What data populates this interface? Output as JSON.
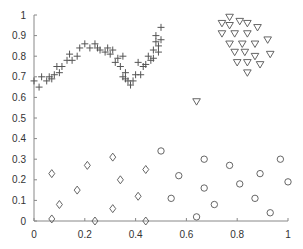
{
  "chart_data": {
    "type": "scatter",
    "title": "",
    "xlabel": "",
    "ylabel": "",
    "xlim": [
      0,
      1
    ],
    "ylim": [
      0,
      1
    ],
    "grid": false,
    "legend": null,
    "x_ticks": [
      "0",
      "0.2",
      "0.4",
      "0.6",
      "0.8",
      "1"
    ],
    "y_ticks": [
      "0",
      "0.1",
      "0.2",
      "0.3",
      "0.4",
      "0.5",
      "0.6",
      "0.7",
      "0.8",
      "0.9",
      "1"
    ],
    "series": [
      {
        "name": "plus",
        "marker": "+",
        "points": [
          [
            0.0,
            0.68
          ],
          [
            0.02,
            0.65
          ],
          [
            0.03,
            0.7
          ],
          [
            0.05,
            0.68
          ],
          [
            0.06,
            0.7
          ],
          [
            0.07,
            0.69
          ],
          [
            0.08,
            0.71
          ],
          [
            0.09,
            0.75
          ],
          [
            0.1,
            0.72
          ],
          [
            0.11,
            0.75
          ],
          [
            0.13,
            0.78
          ],
          [
            0.14,
            0.81
          ],
          [
            0.15,
            0.78
          ],
          [
            0.17,
            0.8
          ],
          [
            0.18,
            0.84
          ],
          [
            0.2,
            0.86
          ],
          [
            0.22,
            0.84
          ],
          [
            0.24,
            0.86
          ],
          [
            0.25,
            0.84
          ],
          [
            0.26,
            0.83
          ],
          [
            0.28,
            0.82
          ],
          [
            0.29,
            0.84
          ],
          [
            0.3,
            0.81
          ],
          [
            0.31,
            0.83
          ],
          [
            0.32,
            0.77
          ],
          [
            0.33,
            0.79
          ],
          [
            0.34,
            0.75
          ],
          [
            0.35,
            0.8
          ],
          [
            0.35,
            0.7
          ],
          [
            0.36,
            0.72
          ],
          [
            0.36,
            0.69
          ],
          [
            0.37,
            0.68
          ],
          [
            0.38,
            0.66
          ],
          [
            0.39,
            0.68
          ],
          [
            0.4,
            0.71
          ],
          [
            0.41,
            0.77
          ],
          [
            0.42,
            0.71
          ],
          [
            0.43,
            0.75
          ],
          [
            0.44,
            0.76
          ],
          [
            0.45,
            0.8
          ],
          [
            0.46,
            0.78
          ],
          [
            0.47,
            0.83
          ],
          [
            0.47,
            0.79
          ],
          [
            0.48,
            0.87
          ],
          [
            0.48,
            0.9
          ],
          [
            0.49,
            0.85
          ],
          [
            0.49,
            0.82
          ],
          [
            0.5,
            0.88
          ],
          [
            0.5,
            0.94
          ]
        ]
      },
      {
        "name": "triangle",
        "marker": "v",
        "points": [
          [
            0.77,
            0.99
          ],
          [
            0.74,
            0.96
          ],
          [
            0.77,
            0.95
          ],
          [
            0.81,
            0.97
          ],
          [
            0.84,
            0.96
          ],
          [
            0.88,
            0.94
          ],
          [
            0.74,
            0.91
          ],
          [
            0.79,
            0.91
          ],
          [
            0.84,
            0.91
          ],
          [
            0.77,
            0.86
          ],
          [
            0.82,
            0.86
          ],
          [
            0.87,
            0.86
          ],
          [
            0.92,
            0.88
          ],
          [
            0.79,
            0.82
          ],
          [
            0.83,
            0.82
          ],
          [
            0.87,
            0.8
          ],
          [
            0.93,
            0.81
          ],
          [
            0.8,
            0.77
          ],
          [
            0.84,
            0.77
          ],
          [
            0.89,
            0.76
          ],
          [
            0.84,
            0.72
          ],
          [
            0.64,
            0.58
          ]
        ]
      },
      {
        "name": "circle",
        "marker": "o",
        "points": [
          [
            0.5,
            0.34
          ],
          [
            0.67,
            0.3
          ],
          [
            0.77,
            0.27
          ],
          [
            0.97,
            0.3
          ],
          [
            0.57,
            0.22
          ],
          [
            0.89,
            0.23
          ],
          [
            0.81,
            0.18
          ],
          [
            1.0,
            0.19
          ],
          [
            0.67,
            0.16
          ],
          [
            0.54,
            0.11
          ],
          [
            0.87,
            0.11
          ],
          [
            0.71,
            0.08
          ],
          [
            0.93,
            0.04
          ],
          [
            0.64,
            0.02
          ]
        ]
      },
      {
        "name": "diamond",
        "marker": "d",
        "points": [
          [
            0.07,
            0.23
          ],
          [
            0.31,
            0.31
          ],
          [
            0.21,
            0.27
          ],
          [
            0.44,
            0.25
          ],
          [
            0.34,
            0.2
          ],
          [
            0.17,
            0.15
          ],
          [
            0.41,
            0.12
          ],
          [
            0.1,
            0.08
          ],
          [
            0.31,
            0.06
          ],
          [
            0.07,
            0.01
          ],
          [
            0.24,
            0.0
          ],
          [
            0.44,
            0.0
          ]
        ]
      }
    ]
  },
  "style": {
    "marker_color": "#555555",
    "axis_color": "#888888",
    "background": "#ffffff"
  }
}
